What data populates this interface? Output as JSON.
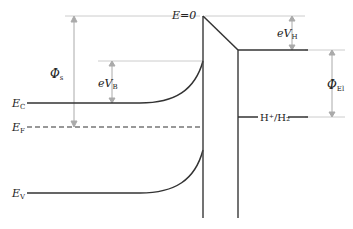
{
  "diagram": {
    "type": "semiconductor-electrolyte band diagram",
    "labels": {
      "E0": "E=0",
      "Phi_s": "Φ",
      "Phi_s_sub": "s",
      "eVB": "eV",
      "eVB_sub": "B",
      "eVH": "eV",
      "eVH_sub": "H",
      "Phi_El": "Φ",
      "Phi_El_sub": "El",
      "Ec": "E",
      "Ec_sub": "C",
      "Ef": "E",
      "Ef_sub": "F",
      "Ev": "E",
      "Ev_sub": "V",
      "redox": "H⁺/H₂"
    },
    "colors": {
      "line": "#333333",
      "guide": "#bbbbbb",
      "text": "#222222"
    }
  }
}
